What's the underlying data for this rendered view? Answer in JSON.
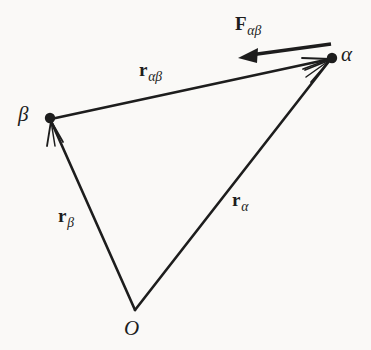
{
  "figure": {
    "kind": "vector-diagram",
    "background_color": "#faf9f7",
    "ink_color": "#1d1d1d"
  },
  "points": {
    "origin": {
      "label": "O",
      "x": 135,
      "y": 310,
      "label_x": 124,
      "label_y": 318,
      "dot": false
    },
    "alpha": {
      "label": "α",
      "x": 332,
      "y": 58,
      "label_x": 341,
      "label_y": 44,
      "dot": true
    },
    "beta": {
      "label": "β",
      "x": 50,
      "y": 118,
      "label_x": 18,
      "label_y": 104,
      "dot": true
    }
  },
  "vectors": [
    {
      "name": "r-alpha",
      "base": "r",
      "subscript": "α",
      "from": "origin",
      "to": "alpha",
      "x1": 135,
      "y1": 310,
      "x2": 332,
      "y2": 58,
      "label_x": 232,
      "label_y": 190,
      "arrowhead": "to"
    },
    {
      "name": "r-beta",
      "base": "r",
      "subscript": "β",
      "from": "origin",
      "to": "beta",
      "x1": 135,
      "y1": 310,
      "x2": 50,
      "y2": 118,
      "label_x": 58,
      "label_y": 206,
      "arrowhead": "to"
    },
    {
      "name": "r-alpha-beta",
      "base": "r",
      "subscript": "αβ",
      "from": "beta",
      "to": "alpha",
      "x1": 50,
      "y1": 118,
      "x2": 332,
      "y2": 58,
      "label_x": 139,
      "label_y": 60,
      "arrowhead": "to"
    },
    {
      "name": "force-alpha-beta",
      "base": "F",
      "subscript": "αβ",
      "from": "alpha",
      "to": "force-tip",
      "x1": 330,
      "y1": 44,
      "x2": 241,
      "y2": 57,
      "label_x": 235,
      "label_y": 14,
      "arrowhead": "to"
    }
  ]
}
